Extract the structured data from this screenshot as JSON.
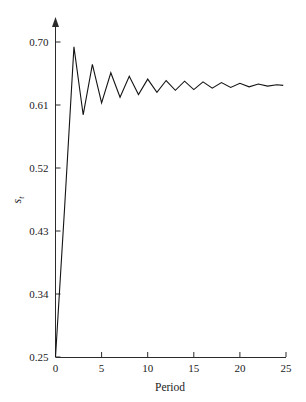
{
  "chart_data": {
    "type": "line",
    "title": "",
    "subtitle": "",
    "xlabel": "Period",
    "ylabel": "s_t",
    "ylabel_base": "s",
    "ylabel_sub": "t",
    "xlim": [
      0,
      25
    ],
    "ylim": [
      0.25,
      0.7
    ],
    "xticks": [
      0,
      5,
      10,
      15,
      20,
      25
    ],
    "xtick_labels": [
      "0",
      "5",
      "10",
      "15",
      "20",
      "25"
    ],
    "yticks": [
      0.25,
      0.34,
      0.43,
      0.52,
      0.61,
      0.7
    ],
    "ytick_labels": [
      "0.25",
      "0.34",
      "0.43",
      "0.52",
      "0.61",
      "0.70"
    ],
    "grid": false,
    "legend": null,
    "legend_position": "none",
    "line_color": "#141414",
    "axis_color": "#2b2b2b",
    "background_color": "#ffffff",
    "annotations": [],
    "series": [
      {
        "name": "s_t",
        "x": [
          0,
          1,
          2,
          3,
          4,
          5,
          6,
          7,
          8,
          9,
          10,
          11,
          12,
          13,
          14,
          15,
          16,
          17,
          18,
          19,
          20,
          21,
          22,
          23,
          24,
          24.7
        ],
        "values": [
          0.25,
          0.466,
          0.693,
          0.596,
          0.668,
          0.613,
          0.656,
          0.621,
          0.651,
          0.625,
          0.647,
          0.628,
          0.645,
          0.631,
          0.644,
          0.632,
          0.643,
          0.634,
          0.642,
          0.635,
          0.641,
          0.636,
          0.64,
          0.637,
          0.639,
          0.638
        ]
      }
    ]
  },
  "figure": {
    "y_axis_arrow": "up-arrow"
  }
}
